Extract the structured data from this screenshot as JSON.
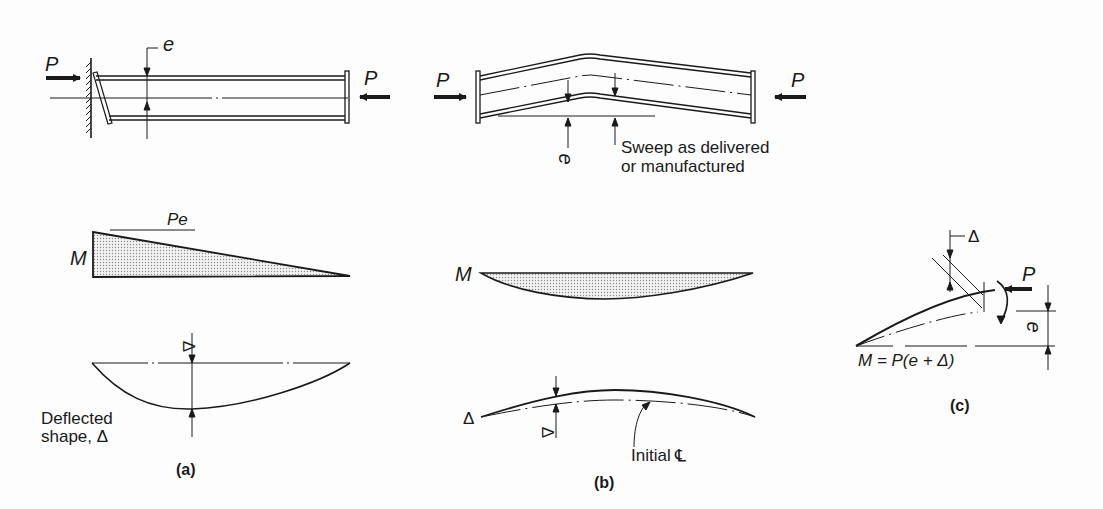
{
  "figure": {
    "panels": [
      {
        "id": "a",
        "caption": "(a)",
        "load_label_left": "P",
        "load_label_right": "P",
        "eccentricity_label": "e",
        "moment_label": "M",
        "moment_peak_label": "Pe",
        "deflection_label_line1": "Deflected",
        "deflection_label_line2": "shape, Δ",
        "delta_marker": "Δ"
      },
      {
        "id": "b",
        "caption": "(b)",
        "load_label_left": "P",
        "load_label_right": "P",
        "eccentricity_label": "e",
        "sweep_note_line1": "Sweep as delivered",
        "sweep_note_line2": "or manufactured",
        "moment_label": "M",
        "delta_left_label": "Δ",
        "delta_marker": "Δ",
        "initial_centerline_label": "Initial ℄"
      },
      {
        "id": "c",
        "caption": "(c)",
        "delta_label": "Δ",
        "load_label": "P",
        "eccentricity_label": "e",
        "moment_equation": "M = P(e + Δ)"
      }
    ],
    "colors": {
      "ink": "#1a1a1a",
      "hatch": "#9a9a9a",
      "background": "#fdfdfd"
    }
  }
}
